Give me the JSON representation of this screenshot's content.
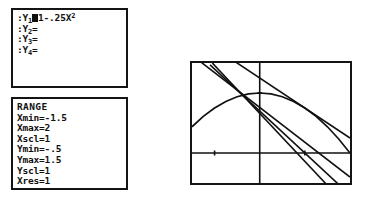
{
  "device": {
    "kind": "graphing-calculator-screens"
  },
  "y_editor": {
    "rows": [
      {
        "prefix": ":Y",
        "index": "1",
        "equal": "=",
        "cursor": true,
        "expr_pre": "1-.25X",
        "expr_sup": "2"
      },
      {
        "prefix": ":Y",
        "index": "2",
        "equal": "=",
        "cursor": false,
        "expr_pre": "",
        "expr_sup": ""
      },
      {
        "prefix": ":Y",
        "index": "3",
        "equal": "=",
        "cursor": false,
        "expr_pre": "",
        "expr_sup": ""
      },
      {
        "prefix": ":Y",
        "index": "4",
        "equal": "=",
        "cursor": false,
        "expr_pre": "",
        "expr_sup": ""
      }
    ],
    "y1_full_text": ":Y1=1-.25X²",
    "y2_full_text": ":Y2=",
    "y3_full_text": ":Y3=",
    "y4_full_text": ":Y4="
  },
  "range": {
    "title": "RANGE",
    "entries": [
      {
        "label": "Xmin",
        "eq": "=",
        "value": "-1.5"
      },
      {
        "label": "Xmax",
        "eq": "=",
        "value": "2"
      },
      {
        "label": "Xscl",
        "eq": "=",
        "value": "1"
      },
      {
        "label": "Ymin",
        "eq": "=",
        "value": "-.5"
      },
      {
        "label": "Ymax",
        "eq": "=",
        "value": "1.5"
      },
      {
        "label": "Yscl",
        "eq": "=",
        "value": "1"
      },
      {
        "label": "Xres",
        "eq": "=",
        "value": "1"
      }
    ]
  },
  "chart_data": {
    "type": "line",
    "title": "",
    "xlabel": "",
    "ylabel": "",
    "xlim": [
      -1.5,
      2
    ],
    "ylim": [
      -0.5,
      1.5
    ],
    "xscl": 1,
    "yscl": 1,
    "grid": false,
    "axes": {
      "x_axis_y": 0,
      "y_axis_x": 0
    },
    "tick_marks": {
      "x": [
        -1,
        1
      ],
      "y": [
        1
      ]
    },
    "series": [
      {
        "name": "Y1 = 1-.25X^2",
        "kind": "parabola",
        "a": -0.25,
        "b": 0,
        "c": 1,
        "x": [
          -1.5,
          -1.25,
          -1.0,
          -0.75,
          -0.5,
          -0.25,
          0,
          0.25,
          0.5,
          0.75,
          1.0,
          1.25,
          1.5,
          1.75,
          2.0
        ],
        "values": [
          0.4375,
          0.609375,
          0.75,
          0.859375,
          0.9375,
          0.984375,
          1,
          0.984375,
          0.9375,
          0.859375,
          0.75,
          0.609375,
          0.4375,
          0.234375,
          0
        ]
      },
      {
        "name": "secant-1",
        "kind": "line",
        "slope": -0.58,
        "intercept": 0.76,
        "x": [
          -1.5,
          2.0
        ],
        "values": [
          1.63,
          -0.4
        ]
      },
      {
        "name": "secant-2",
        "kind": "line",
        "slope": -0.7,
        "intercept": 0.7,
        "x": [
          -1.1,
          2.0
        ],
        "values": [
          1.47,
          -0.7
        ]
      },
      {
        "name": "secant-3",
        "kind": "line",
        "slope": -0.8,
        "intercept": 0.66,
        "x": [
          -1.05,
          2.0
        ],
        "values": [
          1.5,
          -0.94
        ]
      },
      {
        "name": "tangent-at-x1",
        "kind": "line",
        "slope": -0.5,
        "intercept": 1.25,
        "x": [
          -1.5,
          2.0
        ],
        "values": [
          2.0,
          0.25
        ]
      }
    ]
  }
}
